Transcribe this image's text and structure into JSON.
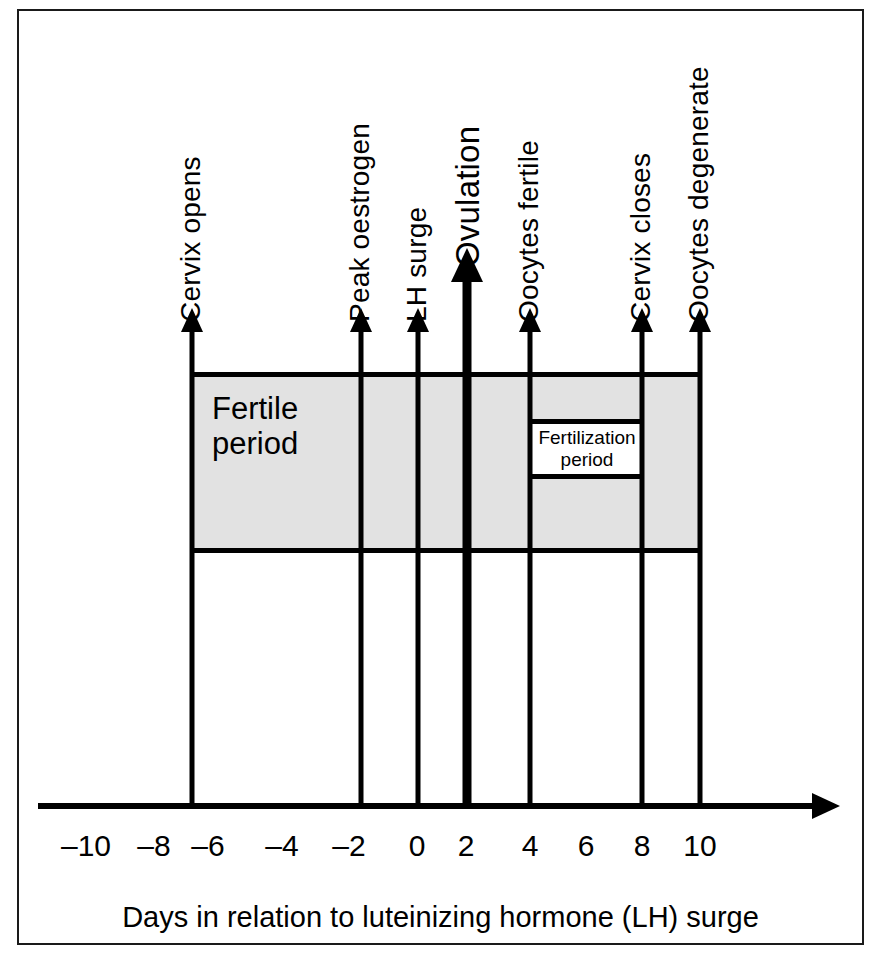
{
  "figure": {
    "caption": "Days in relation to luteinizing hormone (LH) surge",
    "background_color": "#ffffff",
    "shade_color": "#e2e2e2",
    "line_color": "#000000"
  },
  "axis": {
    "tick_labels": [
      "–10",
      "–8",
      "–6",
      "–4",
      "–2",
      "0",
      "2",
      "4",
      "6",
      "8",
      "10"
    ],
    "tick_values": [
      -10,
      -8,
      -6,
      -4,
      -2,
      0,
      2,
      4,
      6,
      8,
      10
    ],
    "tick_x_px": [
      86,
      154,
      208,
      282,
      349,
      417,
      466,
      530,
      586,
      642,
      700
    ],
    "axis_label": "Days in relation to luteinizing hormone (LH) surge",
    "axis_range": [
      -11.5,
      11.5
    ],
    "arrow_direction": "right"
  },
  "events": [
    {
      "label": "Cervix opens",
      "day": -7,
      "x_px": 192,
      "emphasis": "normal"
    },
    {
      "label": "Peak oestrogen",
      "day": -2,
      "x_px": 361,
      "emphasis": "normal"
    },
    {
      "label": "LH surge",
      "day": 0,
      "x_px": 418,
      "emphasis": "normal"
    },
    {
      "label": "Ovulation",
      "day": 2,
      "x_px": 467,
      "emphasis": "bold"
    },
    {
      "label": "Oocytes fertile",
      "day": 4,
      "x_px": 530,
      "emphasis": "normal"
    },
    {
      "label": "Cervix closes",
      "day": 8,
      "x_px": 642,
      "emphasis": "normal"
    },
    {
      "label": "Oocytes degenerate",
      "day": 10,
      "x_px": 700,
      "emphasis": "normal"
    }
  ],
  "bands": {
    "fertile": {
      "label_line1": "Fertile",
      "label_line2": "period",
      "start_day": -7,
      "end_day": 10,
      "start_x_px": 190,
      "end_x_px": 700,
      "top_y_px": 372,
      "bottom_y_px": 553
    },
    "fertilization": {
      "label_line1": "Fertilization",
      "label_line2": "period",
      "start_day": 4,
      "end_day": 8,
      "start_x_px": 531,
      "end_x_px": 643,
      "top_y_px": 419,
      "bottom_y_px": 479
    }
  },
  "chart_data": {
    "type": "diagram",
    "title": "",
    "xlabel": "Days in relation to luteinizing hormone (LH) surge",
    "ylabel": "",
    "xlim": [
      -11.5,
      11.5
    ],
    "grid": false,
    "legend": "none",
    "categories": [
      "–10",
      "–8",
      "–6",
      "–4",
      "–2",
      "0",
      "2",
      "4",
      "6",
      "8",
      "10"
    ],
    "series": [
      {
        "name": "Event markers (day of cycle relative to LH surge)",
        "points": [
          {
            "label": "Cervix opens",
            "x": -7
          },
          {
            "label": "Peak oestrogen",
            "x": -2
          },
          {
            "label": "LH surge",
            "x": 0
          },
          {
            "label": "Ovulation",
            "x": 2
          },
          {
            "label": "Oocytes fertile",
            "x": 4
          },
          {
            "label": "Cervix closes",
            "x": 8
          },
          {
            "label": "Oocytes degenerate",
            "x": 10
          }
        ]
      },
      {
        "name": "Intervals",
        "points": [
          {
            "label": "Fertile period",
            "x_start": -7,
            "x_end": 10
          },
          {
            "label": "Fertilization period",
            "x_start": 4,
            "x_end": 8
          }
        ]
      }
    ]
  }
}
